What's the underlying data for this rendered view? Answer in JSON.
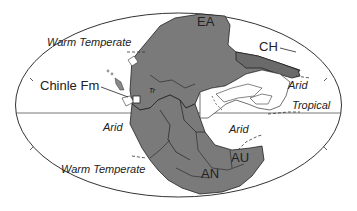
{
  "figure": {
    "type": "paleogeographic map (Pangea, Late Triassic)",
    "colors": {
      "land": "#7a7a7a",
      "land_outline": "#222222",
      "shelf": "#ffffff",
      "ocean": "#ffffff",
      "frame": "#333333"
    },
    "locality": {
      "label": "Chinle Fm",
      "marker": "white-square"
    },
    "continent_labels": {
      "ea": "EA",
      "ch": "CH",
      "an": "AN",
      "au": "AU",
      "tr": "Tr"
    },
    "climate_zones": {
      "warm_temperate_north": "Warm Temperate",
      "arid_northeast": "Arid",
      "tropical": "Tropical",
      "arid_west": "Arid",
      "arid_south": "Arid",
      "warm_temperate_south": "Warm Temperate"
    }
  }
}
